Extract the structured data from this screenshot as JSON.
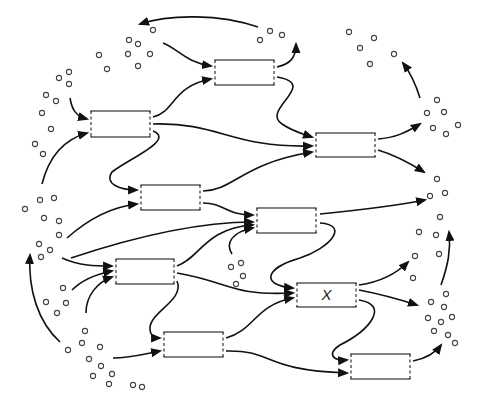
{
  "diagram": {
    "title": "",
    "colors": {
      "stroke": "#111111",
      "box": "#333333",
      "molecule": "#444444",
      "background": "#ffffff"
    },
    "nodes": [
      {
        "id": "A",
        "label": "",
        "x": 215,
        "y": 60,
        "w": 59,
        "h": 25
      },
      {
        "id": "B",
        "label": "",
        "x": 91,
        "y": 111,
        "w": 59,
        "h": 26
      },
      {
        "id": "C",
        "label": "",
        "x": 316,
        "y": 133,
        "w": 59,
        "h": 24
      },
      {
        "id": "D",
        "label": "",
        "x": 141,
        "y": 185,
        "w": 59,
        "h": 25
      },
      {
        "id": "E",
        "label": "",
        "x": 257,
        "y": 208,
        "w": 59,
        "h": 25
      },
      {
        "id": "F",
        "label": "",
        "x": 116,
        "y": 259,
        "w": 58,
        "h": 25
      },
      {
        "id": "X",
        "label": "X",
        "x": 297,
        "y": 283,
        "w": 59,
        "h": 24
      },
      {
        "id": "G",
        "label": "",
        "x": 164,
        "y": 332,
        "w": 59,
        "h": 25
      },
      {
        "id": "H",
        "label": "",
        "x": 351,
        "y": 354,
        "w": 59,
        "h": 25
      }
    ],
    "edges": [
      {
        "from": "pool-top-right",
        "to": "pool-top-left",
        "d": "M 258 27 C 220 14, 170 14, 140 24"
      },
      {
        "from": "pool-top-left",
        "to": "A",
        "d": "M 163 43 C 180 50, 185 62, 211 66"
      },
      {
        "from": "A",
        "to": "pool-top-right",
        "d": "M 277 67 C 290 64, 296 58, 296 44"
      },
      {
        "from": "B",
        "to": "A",
        "d": "M 153 117 C 175 112, 172 86, 211 79"
      },
      {
        "from": "A",
        "to": "C",
        "d": "M 277 77 C 320 84, 260 110, 282 124 C 292 131, 300 133, 312 137"
      },
      {
        "from": "pool-left-top",
        "to": "B",
        "d": "M 70 98 C 72 110, 76 116, 87 119"
      },
      {
        "from": "pool-left-mid",
        "to": "B",
        "d": "M 42 184 C 48 160, 62 140, 87 133"
      },
      {
        "from": "B",
        "to": "C",
        "d": "M 153 124 C 220 122, 230 148, 312 146"
      },
      {
        "from": "B",
        "to": "D",
        "d": "M 153 131 C 175 140, 130 158, 112 172 C 104 184, 120 190, 137 190"
      },
      {
        "from": "D",
        "to": "C",
        "d": "M 203 191 C 235 190, 240 164, 312 152"
      },
      {
        "from": "pool-left-mid",
        "to": "D",
        "d": "M 67 238 C 85 222, 110 207, 137 204"
      },
      {
        "from": "D",
        "to": "E",
        "d": "M 203 203 C 225 203, 225 215, 253 215"
      },
      {
        "from": "C",
        "to": "pool-right-upper",
        "d": "M 378 139 C 395 138, 407 132, 420 124"
      },
      {
        "from": "C",
        "to": "pool-right-mid",
        "d": "M 378 150 C 395 155, 408 162, 424 172"
      },
      {
        "from": "E",
        "to": "pool-right-mid",
        "d": "M 320 214 C 360 210, 400 205, 425 200"
      },
      {
        "from": "pool-right-upper",
        "to": "pool-top-right-far",
        "d": "M 420 98 C 416 85, 412 75, 403 63"
      },
      {
        "from": "pool-left-lower",
        "to": "E",
        "d": "M 71 258 C 125 240, 190 222, 253 222"
      },
      {
        "from": "pool-center-small",
        "to": "E",
        "d": "M 232 254 C 225 243, 232 232, 253 228"
      },
      {
        "from": "E",
        "to": "X",
        "d": "M 320 223 C 350 225, 330 248, 300 258 C 265 268, 260 285, 293 288"
      },
      {
        "from": "pool-left-lower",
        "to": "F",
        "d": "M 62 258 C 80 266, 95 266, 112 266"
      },
      {
        "from": "pool-left-bottom",
        "to": "F",
        "d": "M 72 290 C 80 282, 92 275, 112 271"
      },
      {
        "from": "pool-bottom-left",
        "to": "F",
        "d": "M 86 313 C 86 295, 98 282, 112 277"
      },
      {
        "from": "F",
        "to": "E",
        "d": "M 177 266 C 200 258, 205 228, 253 225"
      },
      {
        "from": "F",
        "to": "X",
        "d": "M 177 273 C 230 282, 230 296, 293 293"
      },
      {
        "from": "F",
        "to": "G",
        "d": "M 177 281 C 185 300, 150 312, 150 328 C 150 337, 155 338, 160 338"
      },
      {
        "from": "pool-bottom-left",
        "to": "G",
        "d": "M 113 358 C 130 358, 140 355, 160 351"
      },
      {
        "from": "G",
        "to": "X",
        "d": "M 226 338 C 255 330, 255 305, 293 298"
      },
      {
        "from": "G",
        "to": "H",
        "d": "M 226 351 C 275 350, 260 370, 347 373"
      },
      {
        "from": "X",
        "to": "pool-right-lower",
        "d": "M 359 285 C 380 282, 395 275, 408 262"
      },
      {
        "from": "X",
        "to": "pool-right-bottom",
        "d": "M 359 290 C 380 294, 395 298, 417 305"
      },
      {
        "from": "X",
        "to": "H",
        "d": "M 359 300 C 390 305, 370 330, 340 345 C 325 355, 335 361, 347 360"
      },
      {
        "from": "H",
        "to": "pool-right-bottom",
        "d": "M 413 361 C 428 358, 436 352, 441 345"
      },
      {
        "from": "pool-right-bottom",
        "to": "pool-right-lower-far",
        "d": "M 441 285 C 448 265, 451 250, 449 232"
      },
      {
        "from": "pool-bottom-left",
        "to": "pool-left-lower",
        "d": "M 60 342 C 38 322, 28 290, 30 255"
      }
    ],
    "molecules": [
      [
        129,
        40
      ],
      [
        138,
        44
      ],
      [
        153,
        30
      ],
      [
        128,
        54
      ],
      [
        150,
        54
      ],
      [
        138,
        66
      ],
      [
        99,
        55
      ],
      [
        107,
        69
      ],
      [
        69,
        72
      ],
      [
        59,
        78
      ],
      [
        69,
        84
      ],
      [
        46,
        95
      ],
      [
        56,
        101
      ],
      [
        42,
        113
      ],
      [
        51,
        129
      ],
      [
        35,
        144
      ],
      [
        43,
        154
      ],
      [
        270,
        31
      ],
      [
        260,
        40
      ],
      [
        282,
        35
      ],
      [
        349,
        32
      ],
      [
        374,
        38
      ],
      [
        360,
        48
      ],
      [
        394,
        54
      ],
      [
        370,
        64
      ],
      [
        437,
        100
      ],
      [
        427,
        113
      ],
      [
        444,
        112
      ],
      [
        433,
        128
      ],
      [
        446,
        134
      ],
      [
        458,
        125
      ],
      [
        437,
        179
      ],
      [
        430,
        196
      ],
      [
        445,
        193
      ],
      [
        440,
        217
      ],
      [
        419,
        232
      ],
      [
        436,
        235
      ],
      [
        415,
        256
      ],
      [
        439,
        254
      ],
      [
        413,
        278
      ],
      [
        40,
        200
      ],
      [
        44,
        218
      ],
      [
        25,
        209
      ],
      [
        54,
        198
      ],
      [
        59,
        221
      ],
      [
        59,
        235
      ],
      [
        39,
        244
      ],
      [
        50,
        250
      ],
      [
        41,
        257
      ],
      [
        63,
        288
      ],
      [
        46,
        302
      ],
      [
        66,
        303
      ],
      [
        57,
        313
      ],
      [
        85,
        331
      ],
      [
        82,
        343
      ],
      [
        68,
        350
      ],
      [
        100,
        347
      ],
      [
        89,
        359
      ],
      [
        101,
        366
      ],
      [
        93,
        376
      ],
      [
        112,
        374
      ],
      [
        109,
        384
      ],
      [
        133,
        385
      ],
      [
        142,
        387
      ],
      [
        231,
        267
      ],
      [
        241,
        263
      ],
      [
        243,
        276
      ],
      [
        236,
        284
      ],
      [
        431,
        302
      ],
      [
        444,
        307
      ],
      [
        446,
        294
      ],
      [
        428,
        318
      ],
      [
        441,
        322
      ],
      [
        452,
        317
      ],
      [
        434,
        331
      ],
      [
        448,
        335
      ],
      [
        455,
        343
      ]
    ]
  }
}
